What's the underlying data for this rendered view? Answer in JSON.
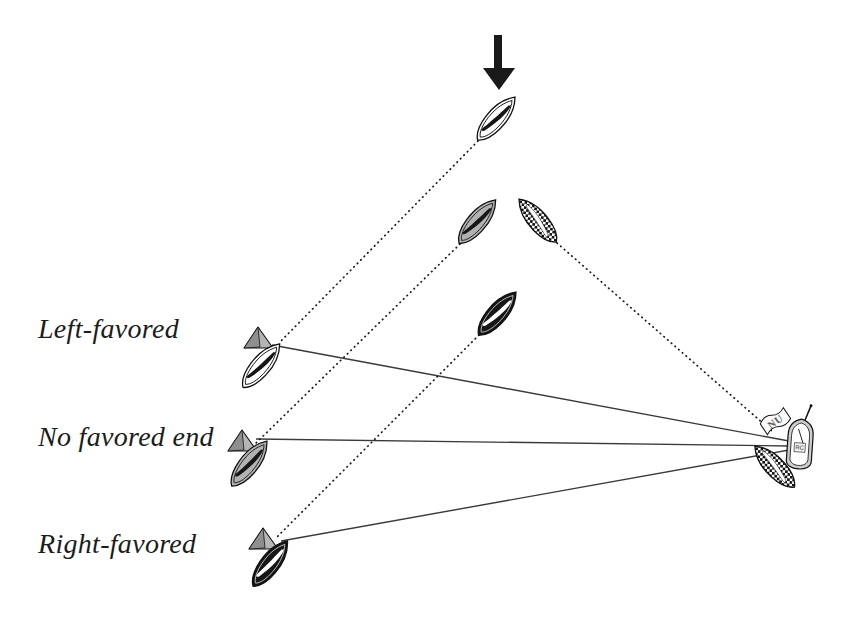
{
  "labels": {
    "left_favored": "Left-favored",
    "no_favored": "No favored end",
    "right_favored": "Right-favored"
  },
  "committee": {
    "flag": "NU",
    "deck_label": "RC"
  },
  "colors": {
    "boat_white": "#ffffff",
    "boat_gray": "#b2b2b2",
    "boat_black": "#161616",
    "pin_gray": "#b5b5b5",
    "pin_shade": "#8f8f8f",
    "committee_hull": "#cccccc",
    "line": "#3a3a3a",
    "dotted": "#1a1a1a",
    "arrow": "#1a1a1a"
  }
}
